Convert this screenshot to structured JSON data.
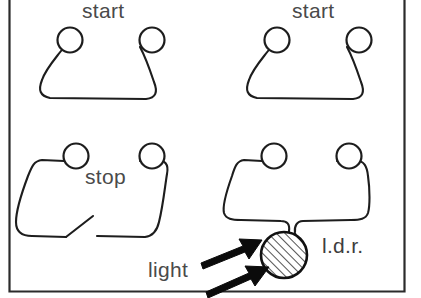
{
  "figure": {
    "background_color": "#ffffff",
    "ink_color": "#1d1d1d",
    "label_color": "#4a4a4a",
    "frame": {
      "left": 8,
      "right": 405,
      "bottom": 292,
      "stroke_color": "#2b2b2b"
    }
  },
  "panels": [
    {
      "id": "start-1",
      "label": "start",
      "kind": "push-to-make-switch",
      "terminals": 2
    },
    {
      "id": "start-2",
      "label": "start",
      "kind": "push-to-make-switch",
      "terminals": 2
    },
    {
      "id": "stop",
      "label": "stop",
      "kind": "push-to-break-switch",
      "terminals": 2
    },
    {
      "id": "ldr",
      "label": "l.d.r.",
      "kind": "light-dependent-resistor",
      "terminals": 2,
      "light_label": "light",
      "light_arrows": 2,
      "body_fill": "hatched"
    }
  ],
  "labels": {
    "start_top_left": "start",
    "start_top_right": "start",
    "stop": "stop",
    "light": "light",
    "ldr": "l.d.r."
  }
}
